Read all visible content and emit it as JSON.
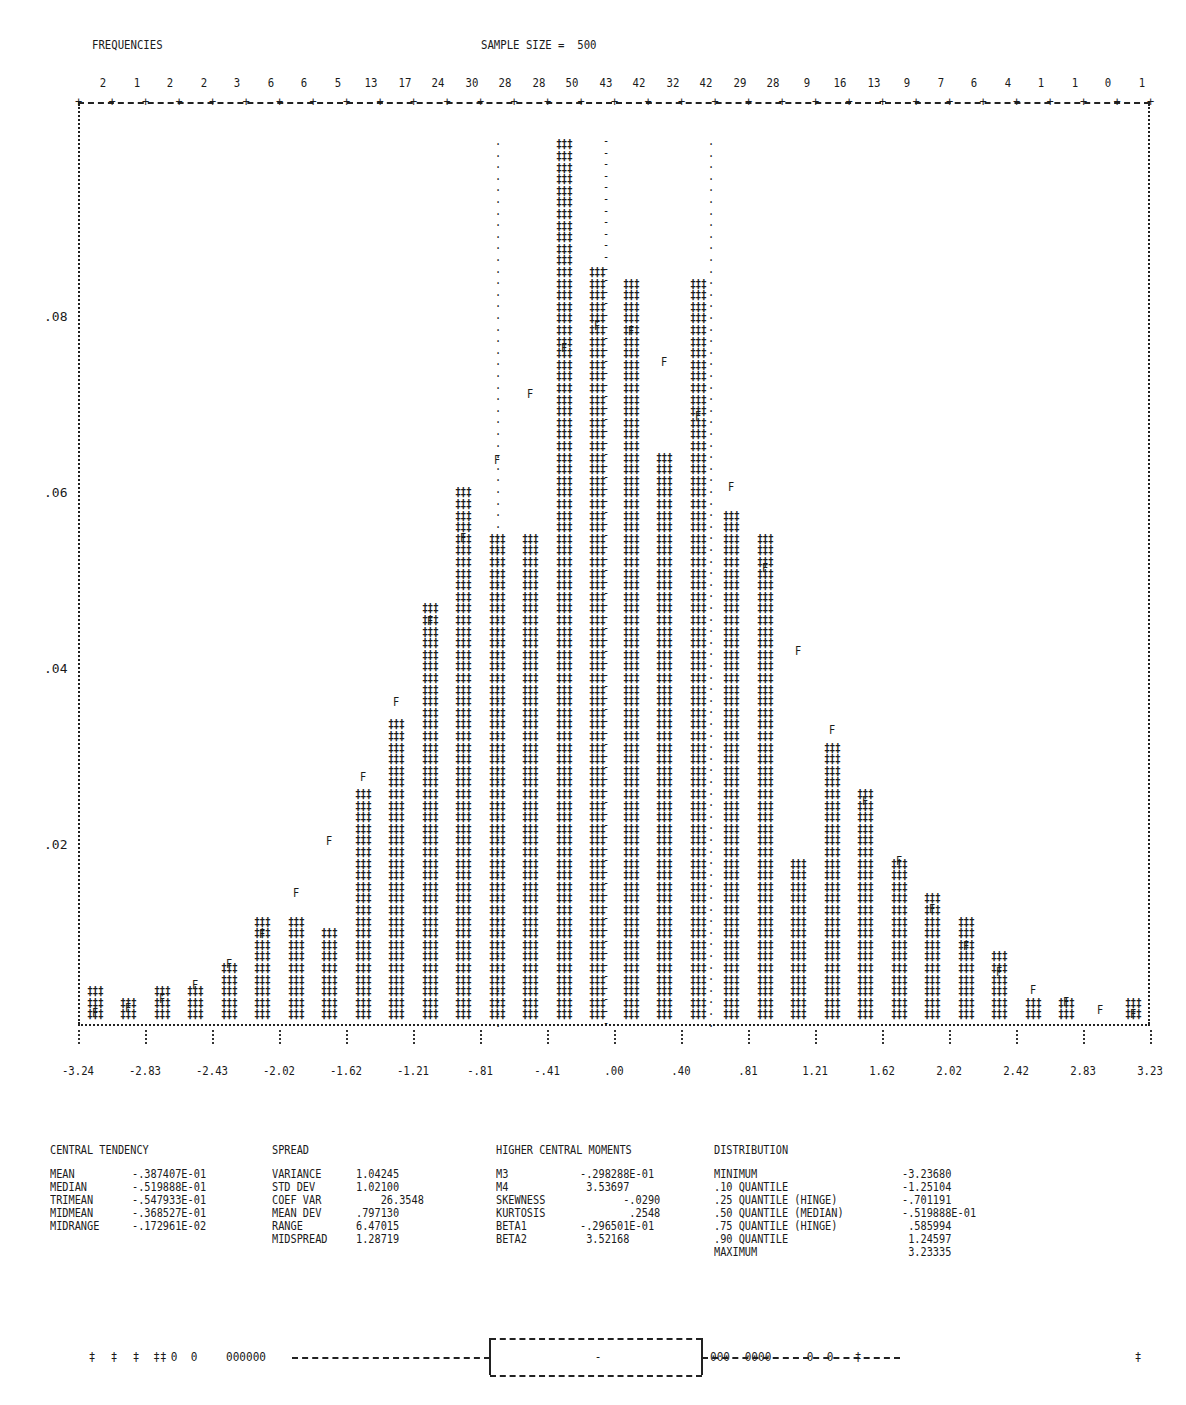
{
  "header": {
    "frequencies_label": "FREQUENCIES",
    "sample_size_label": "SAMPLE SIZE =  500"
  },
  "chart_data": {
    "type": "bar",
    "xlabel": "",
    "ylabel": "Relative frequency",
    "bins": 32,
    "frequencies": [
      2,
      1,
      2,
      2,
      3,
      6,
      6,
      5,
      13,
      17,
      24,
      30,
      28,
      28,
      50,
      43,
      42,
      32,
      42,
      29,
      28,
      9,
      16,
      13,
      9,
      7,
      6,
      4,
      1,
      1,
      0,
      1
    ],
    "sample_size": 500,
    "x_tick_labels": [
      "-3.24",
      "-2.83",
      "-2.43",
      "-2.02",
      "-1.62",
      "-1.21",
      "-.81",
      "-.41",
      ".00",
      ".40",
      ".81",
      "1.21",
      "1.62",
      "2.02",
      "2.42",
      "2.83",
      "3.23"
    ],
    "y_tick_labels": [
      ".08",
      ".06",
      ".04",
      ".02"
    ],
    "y_tick_values": [
      0.08,
      0.06,
      0.04,
      0.02
    ],
    "ylim": [
      0,
      0.1
    ],
    "fit": "normal (F markers)",
    "markers": {
      "bar": "‡",
      "fit": "F",
      "median": "-",
      "quartile": "."
    },
    "grid": false,
    "legend": "none"
  },
  "stats": {
    "central_tendency": {
      "title": "CENTRAL TENDENCY",
      "rows": [
        {
          "label": "MEAN",
          "value": "-.387407E-01"
        },
        {
          "label": "MEDIAN",
          "value": "-.519888E-01"
        },
        {
          "label": "TRIMEAN",
          "value": "-.547933E-01"
        },
        {
          "label": "MIDMEAN",
          "value": "-.368527E-01"
        },
        {
          "label": "MIDRANGE",
          "value": "-.172961E-02"
        }
      ]
    },
    "spread": {
      "title": "SPREAD",
      "rows": [
        {
          "label": "VARIANCE",
          "value": "1.04245"
        },
        {
          "label": "STD DEV",
          "value": "1.02100"
        },
        {
          "label": "COEF VAR",
          "value": "    26.3548"
        },
        {
          "label": "MEAN DEV",
          "value": ".797130"
        },
        {
          "label": "RANGE",
          "value": "6.47015"
        },
        {
          "label": "MIDSPREAD",
          "value": "1.28719"
        }
      ]
    },
    "higher_moments": {
      "title": "HIGHER CENTRAL MOMENTS",
      "rows": [
        {
          "label": "M3",
          "value": "-.298288E-01"
        },
        {
          "label": "M4",
          "value": " 3.53697"
        },
        {
          "label": "SKEWNESS",
          "value": "       -.0290"
        },
        {
          "label": "KURTOSIS",
          "value": "        .2548"
        },
        {
          "label": "BETA1",
          "value": "-.296501E-01"
        },
        {
          "label": "BETA2",
          "value": " 3.52168"
        }
      ]
    },
    "distribution": {
      "title": "DISTRIBUTION",
      "rows": [
        {
          "label": "MINIMUM",
          "value": "-3.23680"
        },
        {
          "label": ".10 QUANTILE",
          "value": "-1.25104"
        },
        {
          "label": ".25 QUANTILE (HINGE)",
          "value": "-.701191"
        },
        {
          "label": ".50 QUANTILE (MEDIAN)",
          "value": "-.519888E-01"
        },
        {
          "label": ".75 QUANTILE (HINGE)",
          "value": " .585994"
        },
        {
          "label": ".90 QUANTILE",
          "value": " 1.24597"
        },
        {
          "label": "MAXIMUM",
          "value": " 3.23335"
        }
      ]
    }
  },
  "boxplot": {
    "left_outliers": [
      "‡",
      "‡",
      "‡",
      "‡‡",
      "0",
      "0",
      "000000"
    ],
    "right_outliers": [
      "000",
      "0000",
      "0",
      "0",
      "‡",
      "‡"
    ],
    "median_mark": "-"
  }
}
